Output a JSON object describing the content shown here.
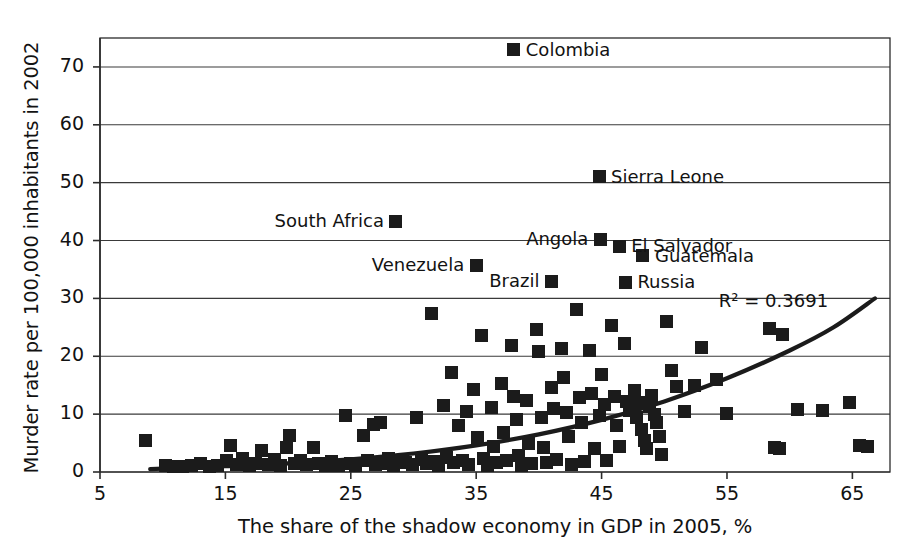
{
  "chart_data": {
    "type": "scatter",
    "title": "",
    "xlabel": "The share of the shadow economy in GDP in 2005, %",
    "ylabel": "Murder rate per 100,000 inhabitants in 2002",
    "xlim": [
      5,
      68
    ],
    "ylim": [
      0,
      75
    ],
    "xticks": [
      5,
      15,
      25,
      35,
      45,
      55,
      65
    ],
    "yticks": [
      0,
      10,
      20,
      30,
      40,
      50,
      60,
      70
    ],
    "grid": "horizontal",
    "legend": "none",
    "annotations": [
      {
        "text": "R² = 0.3691",
        "x": 58.5,
        "y": 29.5
      }
    ],
    "trendline": {
      "type": "exponential",
      "r_squared": 0.3691,
      "label": "R² = 0.3691",
      "points": [
        [
          9.0,
          0.5
        ],
        [
          15.0,
          1.0
        ],
        [
          20.0,
          1.5
        ],
        [
          25.0,
          2.2
        ],
        [
          30.0,
          3.2
        ],
        [
          35.0,
          4.6
        ],
        [
          40.0,
          6.5
        ],
        [
          45.0,
          9.0
        ],
        [
          50.0,
          12.2
        ],
        [
          55.0,
          16.2
        ],
        [
          60.0,
          21.0
        ],
        [
          63.5,
          25.0
        ],
        [
          66.8,
          30.0
        ]
      ]
    },
    "labeled_points": [
      {
        "label": "Colombia",
        "x": 38.0,
        "y": 73.0,
        "label_side": "right"
      },
      {
        "label": "Sierra Leone",
        "x": 44.8,
        "y": 51.0,
        "label_side": "right"
      },
      {
        "label": "South Africa",
        "x": 28.6,
        "y": 43.3,
        "label_side": "left"
      },
      {
        "label": "Angola",
        "x": 44.9,
        "y": 40.2,
        "label_side": "left"
      },
      {
        "label": "El Salvador",
        "x": 46.4,
        "y": 39.0,
        "label_side": "right"
      },
      {
        "label": "Guatemala",
        "x": 48.3,
        "y": 37.4,
        "label_side": "right"
      },
      {
        "label": "Venezuela",
        "x": 35.0,
        "y": 35.7,
        "label_side": "left"
      },
      {
        "label": "Brazil",
        "x": 41.0,
        "y": 33.0,
        "label_side": "left"
      },
      {
        "label": "Russia",
        "x": 46.9,
        "y": 32.8,
        "label_side": "right"
      }
    ],
    "points": [
      [
        8.6,
        5.4
      ],
      [
        10.2,
        1.2
      ],
      [
        10.9,
        0.9
      ],
      [
        11.6,
        1.0
      ],
      [
        12.3,
        1.1
      ],
      [
        13.0,
        1.4
      ],
      [
        13.7,
        1.0
      ],
      [
        14.4,
        1.2
      ],
      [
        15.1,
        2.0
      ],
      [
        15.4,
        4.6
      ],
      [
        15.9,
        1.3
      ],
      [
        16.4,
        2.3
      ],
      [
        16.9,
        1.1
      ],
      [
        17.4,
        1.5
      ],
      [
        17.9,
        3.7
      ],
      [
        18.4,
        1.3
      ],
      [
        18.9,
        2.1
      ],
      [
        19.4,
        1.2
      ],
      [
        19.9,
        4.3
      ],
      [
        20.1,
        6.3
      ],
      [
        20.5,
        1.4
      ],
      [
        21.0,
        2.0
      ],
      [
        21.5,
        1.3
      ],
      [
        22.0,
        4.3
      ],
      [
        22.4,
        1.5
      ],
      [
        23.0,
        1.1
      ],
      [
        23.5,
        1.9
      ],
      [
        24.0,
        1.2
      ],
      [
        24.6,
        9.7
      ],
      [
        25.0,
        1.5
      ],
      [
        25.4,
        1.2
      ],
      [
        26.0,
        6.3
      ],
      [
        26.3,
        2.0
      ],
      [
        26.8,
        8.2
      ],
      [
        27.0,
        1.3
      ],
      [
        27.4,
        8.6
      ],
      [
        27.6,
        1.5
      ],
      [
        28.0,
        2.3
      ],
      [
        28.4,
        1.1
      ],
      [
        28.9,
        2.0
      ],
      [
        29.4,
        1.7
      ],
      [
        29.9,
        1.3
      ],
      [
        30.2,
        9.5
      ],
      [
        30.6,
        2.2
      ],
      [
        31.0,
        1.4
      ],
      [
        31.4,
        27.4
      ],
      [
        31.6,
        1.8
      ],
      [
        32.0,
        1.1
      ],
      [
        32.4,
        11.5
      ],
      [
        32.6,
        2.5
      ],
      [
        33.0,
        17.2
      ],
      [
        33.2,
        1.6
      ],
      [
        33.6,
        8.1
      ],
      [
        33.9,
        2.0
      ],
      [
        34.2,
        10.4
      ],
      [
        34.4,
        1.3
      ],
      [
        34.8,
        14.2
      ],
      [
        35.1,
        6.0
      ],
      [
        35.4,
        23.6
      ],
      [
        35.6,
        2.4
      ],
      [
        35.9,
        1.2
      ],
      [
        36.2,
        11.1
      ],
      [
        36.4,
        4.4
      ],
      [
        36.6,
        1.6
      ],
      [
        37.0,
        15.3
      ],
      [
        37.2,
        6.8
      ],
      [
        37.4,
        2.0
      ],
      [
        37.8,
        21.8
      ],
      [
        38.0,
        13.0
      ],
      [
        38.2,
        9.0
      ],
      [
        38.4,
        2.8
      ],
      [
        38.6,
        1.2
      ],
      [
        39.0,
        12.4
      ],
      [
        39.2,
        5.0
      ],
      [
        39.4,
        1.4
      ],
      [
        39.8,
        24.6
      ],
      [
        40.0,
        20.8
      ],
      [
        40.2,
        9.5
      ],
      [
        40.4,
        4.2
      ],
      [
        40.6,
        1.6
      ],
      [
        41.0,
        14.6
      ],
      [
        41.2,
        11.0
      ],
      [
        41.4,
        2.1
      ],
      [
        41.8,
        21.4
      ],
      [
        42.0,
        16.3
      ],
      [
        42.2,
        10.2
      ],
      [
        42.4,
        6.2
      ],
      [
        42.6,
        1.3
      ],
      [
        43.0,
        28.0
      ],
      [
        43.2,
        12.8
      ],
      [
        43.4,
        8.6
      ],
      [
        43.6,
        1.8
      ],
      [
        44.0,
        21.0
      ],
      [
        44.2,
        13.6
      ],
      [
        44.4,
        4.1
      ],
      [
        44.8,
        9.7
      ],
      [
        45.0,
        16.8
      ],
      [
        45.2,
        11.6
      ],
      [
        45.4,
        2.0
      ],
      [
        45.8,
        25.4
      ],
      [
        46.0,
        13.0
      ],
      [
        46.2,
        8.0
      ],
      [
        46.4,
        4.4
      ],
      [
        46.8,
        22.2
      ],
      [
        47.0,
        12.2
      ],
      [
        47.2,
        10.6
      ],
      [
        47.4,
        11.2
      ],
      [
        47.6,
        14.0
      ],
      [
        47.8,
        9.4
      ],
      [
        48.0,
        12.0
      ],
      [
        48.2,
        7.4
      ],
      [
        48.4,
        5.4
      ],
      [
        48.6,
        4.0
      ],
      [
        48.8,
        11.4
      ],
      [
        49.0,
        13.2
      ],
      [
        49.2,
        10.0
      ],
      [
        49.4,
        8.6
      ],
      [
        49.6,
        6.2
      ],
      [
        49.8,
        3.0
      ],
      [
        50.2,
        26.0
      ],
      [
        50.6,
        17.6
      ],
      [
        51.0,
        14.8
      ],
      [
        51.6,
        10.4
      ],
      [
        52.4,
        15.0
      ],
      [
        53.0,
        21.6
      ],
      [
        54.2,
        16.0
      ],
      [
        55.0,
        10.1
      ],
      [
        58.4,
        24.8
      ],
      [
        58.8,
        4.2
      ],
      [
        59.2,
        4.0
      ],
      [
        59.4,
        23.8
      ],
      [
        60.6,
        10.8
      ],
      [
        62.6,
        10.6
      ],
      [
        64.8,
        12.0
      ],
      [
        65.6,
        4.6
      ],
      [
        66.2,
        4.4
      ]
    ]
  }
}
